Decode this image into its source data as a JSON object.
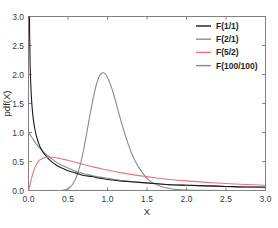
{
  "chart_data": {
    "type": "line",
    "title": "",
    "xlabel": "X",
    "ylabel": "pdf(X)",
    "xlim": [
      0.0,
      3.0
    ],
    "ylim": [
      0.0,
      3.0
    ],
    "xticks": [
      "0.0",
      "0.5",
      "1.0",
      "1.5",
      "2.0",
      "2.5",
      "3.0"
    ],
    "xtick_values": [
      0.0,
      0.5,
      1.0,
      1.5,
      2.0,
      2.5,
      3.0
    ],
    "yticks": [
      "0.0",
      "0.5",
      "1.0",
      "1.5",
      "2.0",
      "2.5",
      "3.0"
    ],
    "ytick_values": [
      0.0,
      0.5,
      1.0,
      1.5,
      2.0,
      2.5,
      3.0
    ],
    "grid": false,
    "frame": "box",
    "tick_direction": "in",
    "legend_position": "top-right",
    "axis_color": "#808080",
    "series": [
      {
        "name": "F(1/1)",
        "color": "#1a1a1a",
        "distribution": "F",
        "d1": 1,
        "d2": 1,
        "x": [
          0.005,
          0.01,
          0.02,
          0.03,
          0.04,
          0.05,
          0.06,
          0.08,
          0.1,
          0.12,
          0.15,
          0.18,
          0.2,
          0.25,
          0.3,
          0.35,
          0.4,
          0.45,
          0.5,
          0.6,
          0.7,
          0.8,
          0.9,
          1.0,
          1.2,
          1.4,
          1.6,
          1.8,
          2.0,
          2.25,
          2.5,
          2.75,
          3.0
        ],
        "y": [
          4.48,
          3.15,
          2.21,
          1.79,
          1.54,
          1.37,
          1.24,
          1.06,
          0.94,
          0.85,
          0.74,
          0.67,
          0.63,
          0.55,
          0.49,
          0.44,
          0.4,
          0.37,
          0.34,
          0.3,
          0.26,
          0.24,
          0.21,
          0.19,
          0.16,
          0.14,
          0.12,
          0.1,
          0.09,
          0.08,
          0.07,
          0.06,
          0.06
        ]
      },
      {
        "name": "F(2/1)",
        "color": "#8c8c8c",
        "distribution": "F",
        "d1": 2,
        "d2": 1,
        "x": [
          0.0,
          0.02,
          0.05,
          0.1,
          0.15,
          0.2,
          0.25,
          0.3,
          0.35,
          0.4,
          0.5,
          0.6,
          0.7,
          0.8,
          0.9,
          1.0,
          1.2,
          1.4,
          1.6,
          1.8,
          2.0,
          2.25,
          2.5,
          2.75,
          3.0
        ],
        "y": [
          1.0,
          0.96,
          0.9,
          0.8,
          0.72,
          0.65,
          0.59,
          0.54,
          0.49,
          0.45,
          0.39,
          0.33,
          0.29,
          0.26,
          0.23,
          0.21,
          0.17,
          0.14,
          0.12,
          0.1,
          0.09,
          0.08,
          0.07,
          0.06,
          0.05
        ]
      },
      {
        "name": "F(5/2)",
        "color": "#e8747c",
        "distribution": "F",
        "d1": 5,
        "d2": 2,
        "x": [
          0.0,
          0.02,
          0.05,
          0.08,
          0.1,
          0.13,
          0.16,
          0.2,
          0.25,
          0.3,
          0.35,
          0.4,
          0.45,
          0.5,
          0.6,
          0.7,
          0.8,
          0.9,
          1.0,
          1.2,
          1.4,
          1.6,
          1.8,
          2.0,
          2.25,
          2.5,
          2.75,
          3.0
        ],
        "y": [
          0.0,
          0.1,
          0.27,
          0.39,
          0.45,
          0.51,
          0.54,
          0.565,
          0.575,
          0.573,
          0.565,
          0.552,
          0.537,
          0.52,
          0.484,
          0.448,
          0.414,
          0.382,
          0.352,
          0.3,
          0.256,
          0.22,
          0.19,
          0.166,
          0.14,
          0.12,
          0.103,
          0.09
        ]
      },
      {
        "name": "F(100/100)",
        "color": "#8a8a8a",
        "distribution": "F",
        "d1": 100,
        "d2": 100,
        "x": [
          0.35,
          0.4,
          0.45,
          0.5,
          0.55,
          0.6,
          0.65,
          0.7,
          0.75,
          0.8,
          0.85,
          0.9,
          0.95,
          1.0,
          1.05,
          1.1,
          1.15,
          1.2,
          1.25,
          1.3,
          1.35,
          1.4,
          1.5,
          1.6,
          1.7,
          1.8,
          1.9,
          2.0,
          2.2,
          2.5,
          3.0
        ],
        "y": [
          0.0,
          0.0,
          0.01,
          0.03,
          0.09,
          0.21,
          0.42,
          0.72,
          1.09,
          1.46,
          1.78,
          1.98,
          2.03,
          1.95,
          1.78,
          1.55,
          1.3,
          1.06,
          0.85,
          0.66,
          0.51,
          0.39,
          0.21,
          0.11,
          0.06,
          0.03,
          0.015,
          0.008,
          0.002,
          0.0,
          0.0
        ]
      }
    ]
  },
  "legend": {
    "entries": [
      {
        "label": "F(1/1)",
        "color": "#1a1a1a"
      },
      {
        "label": "F(2/1)",
        "color": "#8c8c8c"
      },
      {
        "label": "F(5/2)",
        "color": "#e8747c"
      },
      {
        "label": "F(100/100)",
        "color": "#8a8a8a"
      }
    ]
  }
}
